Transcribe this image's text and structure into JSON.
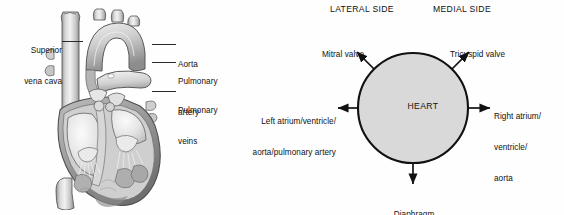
{
  "figure": {
    "background_color": "#fefefe",
    "ink_color": "#111111"
  },
  "anatomy_panel": {
    "name": "heart-anatomy-illustration",
    "description": "Grayscale cutaway illustration of the human heart",
    "labels": [
      {
        "id": "superior-vena-cava",
        "lines": [
          "Superior",
          "vena cava"
        ],
        "side": "left"
      },
      {
        "id": "aorta",
        "lines": [
          "Aorta"
        ],
        "side": "right"
      },
      {
        "id": "pulmonary-artery",
        "lines": [
          "Pulmonary",
          "artery"
        ],
        "side": "right"
      },
      {
        "id": "pulmonary-veins",
        "lines": [
          "Pulmonary",
          "veins"
        ],
        "side": "right"
      }
    ]
  },
  "schematic_panel": {
    "name": "heart-orientation-schematic",
    "headers": {
      "lateral": "LATERAL SIDE",
      "medial": "MEDIAL SIDE"
    },
    "center_label": "HEART",
    "circle": {
      "fill": "#d9d9d9",
      "stroke": "#111111",
      "center_x": 131,
      "center_y": 108,
      "radius": 55
    },
    "arrows": [
      {
        "id": "mitral-valve",
        "label": "Mitral valve",
        "direction": "up-left",
        "lines": [
          "Mitral valve"
        ]
      },
      {
        "id": "tricuspid-valve",
        "label": "Tricuspid valve",
        "direction": "up-right",
        "lines": [
          "Tricuspid valve"
        ]
      },
      {
        "id": "left-side-structures",
        "label": "Left atrium/ventricle/aorta/pulmonary artery",
        "direction": "left",
        "lines": [
          "Left atrium/ventricle/",
          "aorta/pulmonary artery"
        ]
      },
      {
        "id": "right-side-structures",
        "label": "Right atrium/ventricle/aorta",
        "direction": "right",
        "lines": [
          "Right atrium/",
          "ventricle/",
          "aorta"
        ]
      },
      {
        "id": "diaphragm",
        "label": "Diaphragm",
        "direction": "down",
        "lines": [
          "Diaphragm"
        ]
      }
    ]
  }
}
